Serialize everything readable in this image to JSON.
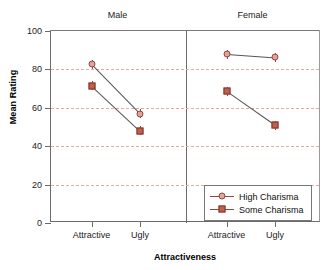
{
  "chart_data": {
    "type": "line",
    "title": "",
    "xlabel": "Attractiveness",
    "ylabel": "Mean Rating",
    "ylim": [
      0,
      100
    ],
    "yticks": [
      0,
      20,
      40,
      60,
      80,
      100
    ],
    "ytick_labels": [
      "0",
      "20",
      "40",
      "60",
      "80",
      "100"
    ],
    "grid": "horizontal dashed gridlines at 20, 40, 60, 80",
    "legend_position": "bottom-right inside plot",
    "panels": [
      {
        "name": "Male",
        "categories": [
          "Attractive",
          "Ugly"
        ],
        "series": [
          {
            "name": "High Charisma",
            "marker": "circle",
            "values": [
              82.7,
              56.8
            ]
          },
          {
            "name": "Some Charisma",
            "marker": "square",
            "values": [
              71.6,
              48.0
            ]
          }
        ]
      },
      {
        "name": "Female",
        "categories": [
          "Attractive",
          "Ugly"
        ],
        "series": [
          {
            "name": "High Charisma",
            "marker": "circle",
            "values": [
              88.0,
              86.2
            ]
          },
          {
            "name": "Some Charisma",
            "marker": "square",
            "values": [
              68.5,
              50.8
            ]
          }
        ]
      }
    ],
    "legend": [
      {
        "label": "High Charisma",
        "marker": "circle"
      },
      {
        "label": "Some Charisma",
        "marker": "square"
      }
    ],
    "colors": {
      "gridline": "#e8a9a0",
      "axis": "#6b6b6b",
      "line": "#555555",
      "high_charisma_fill": "#e8a197",
      "high_charisma_edge": "#8e4940",
      "some_charisma_fill": "#c25f4e",
      "some_charisma_edge": "#7d3428"
    }
  },
  "axes": {
    "y_title": "Mean Rating",
    "x_title": "Attractiveness"
  },
  "strips": {
    "male": "Male",
    "female": "Female"
  }
}
